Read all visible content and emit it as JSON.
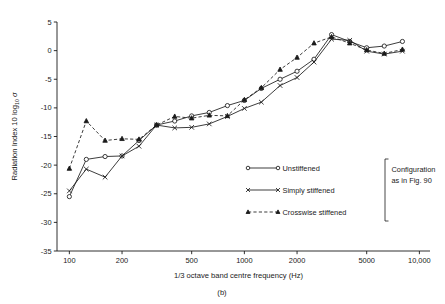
{
  "figure": {
    "caption": "(b)",
    "annotation_line1": "Configuration",
    "annotation_line2": "as in Fig. 90"
  },
  "chart_data": {
    "type": "line",
    "title": "",
    "xlabel": "1/3 octave band centre frequency (Hz)",
    "ylabel_prefix": "Radiation Index 10 log",
    "ylabel_sub": "10",
    "ylabel_suffix": "σ",
    "xscale": "log",
    "xlim": [
      85,
      11500
    ],
    "ylim": [
      -35,
      5
    ],
    "grid": false,
    "legend_position": "inside-right",
    "xticks": [
      100,
      200,
      500,
      1000,
      2000,
      5000,
      10000
    ],
    "xtick_labels": [
      "100",
      "200",
      "500",
      "1000",
      "2000",
      "5000",
      "10,000"
    ],
    "yticks": [
      5,
      0,
      -5,
      -10,
      -15,
      -20,
      -25,
      -30,
      -35
    ],
    "ytick_labels": [
      "5",
      "0",
      "-5",
      "-10",
      "-15",
      "-20",
      "-25",
      "-30",
      "-35"
    ],
    "x": [
      100,
      125,
      160,
      200,
      250,
      315,
      400,
      500,
      630,
      800,
      1000,
      1250,
      1600,
      2000,
      2500,
      3150,
      4000,
      5000,
      6300,
      8000
    ],
    "series": [
      {
        "name": "Unstiffened",
        "marker": "circle-open",
        "linestyle": "solid",
        "values": [
          -25.5,
          -19.0,
          -18.5,
          -18.4,
          -15.7,
          -13.0,
          -12.3,
          -11.4,
          -10.8,
          -9.6,
          -8.7,
          -6.6,
          -5.0,
          -3.6,
          -1.5,
          2.8,
          1.6,
          0.5,
          0.8,
          1.6
        ]
      },
      {
        "name": "Simply stiffened",
        "marker": "cross",
        "linestyle": "solid",
        "values": [
          -24.5,
          -20.7,
          -22.1,
          -18.4,
          -16.7,
          -13.0,
          -13.5,
          -13.4,
          -12.8,
          -11.5,
          -10.1,
          -9.0,
          -6.1,
          -4.7,
          -2.0,
          2.0,
          1.8,
          -0.1,
          -0.6,
          -0.1
        ]
      },
      {
        "name": "Crosswise stiffened",
        "marker": "triangle",
        "linestyle": "dashed",
        "values": [
          -20.6,
          -12.3,
          -15.7,
          -15.4,
          -15.5,
          -13.0,
          -11.5,
          -11.8,
          -11.3,
          -11.4,
          -8.6,
          -6.5,
          -3.3,
          -1.2,
          1.3,
          2.4,
          1.3,
          0.1,
          -0.5,
          0.2
        ]
      }
    ],
    "legend": [
      {
        "label": "Unstiffened",
        "marker": "circle-open",
        "linestyle": "solid"
      },
      {
        "label": "Simply stiffened",
        "marker": "cross",
        "linestyle": "solid"
      },
      {
        "label": "Crosswise stiffened",
        "marker": "triangle",
        "linestyle": "dashed"
      }
    ]
  }
}
